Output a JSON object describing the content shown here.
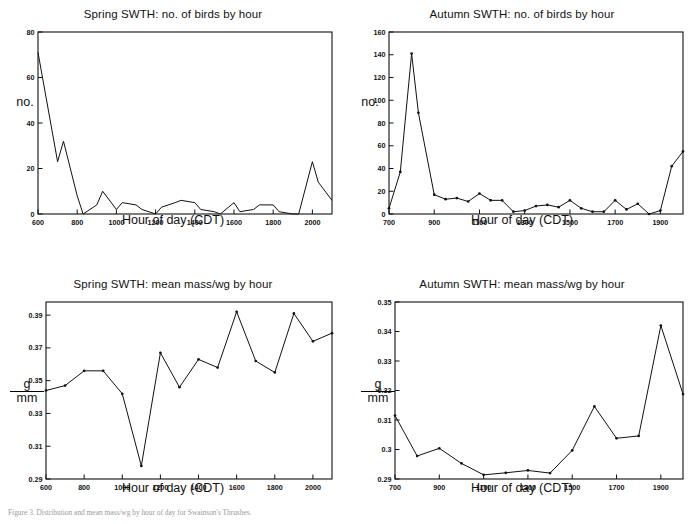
{
  "figure": {
    "caption": "Figure 3. Distribution and mean mass/wg by hour of day for Swainson's Thrushes."
  },
  "panels": [
    {
      "id": "spring-count",
      "title": "Spring SWTH: no. of birds by hour",
      "xlabel": "Hour of day (CDT)",
      "ylabel_type": "plain",
      "ylabel": "no.",
      "ylabel_num": "",
      "ylabel_den": ""
    },
    {
      "id": "autumn-count",
      "title": "Autumn SWTH: no. of birds by hour",
      "xlabel": "Hour of day (CDT)",
      "ylabel_type": "plain",
      "ylabel": "no.",
      "ylabel_num": "",
      "ylabel_den": ""
    },
    {
      "id": "spring-mass",
      "title": "Spring SWTH: mean mass/wg by hour",
      "xlabel": "Hour of day (CDT)",
      "ylabel_type": "fraction",
      "ylabel": "g/mm",
      "ylabel_num": "g",
      "ylabel_den": "mm"
    },
    {
      "id": "autumn-mass",
      "title": "Autumn SWTH: mean mass/wg by hour",
      "xlabel": "Hour of day (CDT)",
      "ylabel_type": "fraction",
      "ylabel": "g/mm",
      "ylabel_num": "g",
      "ylabel_den": "mm"
    }
  ],
  "chart_data": [
    {
      "id": "spring-count",
      "type": "line",
      "title": "Spring SWTH: no. of birds by hour",
      "xlabel": "Hour of day (CDT)",
      "ylabel": "no.",
      "xlim": [
        600,
        2100
      ],
      "ylim": [
        0,
        80
      ],
      "xticks": [
        600,
        800,
        1000,
        1200,
        1400,
        1600,
        1800,
        2000
      ],
      "xticklabels": [
        "600",
        "800",
        "1000",
        "1200",
        "1400",
        "1600",
        "1800",
        "2000"
      ],
      "yticks": [
        0,
        20,
        40,
        60,
        80
      ],
      "yticklabels": [
        "0",
        "20",
        "40",
        "60",
        "80"
      ],
      "grid": false,
      "legend": "none",
      "markers": false,
      "x": [
        600,
        700,
        730,
        800,
        830,
        900,
        930,
        1000,
        1030,
        1100,
        1130,
        1200,
        1230,
        1300,
        1330,
        1400,
        1430,
        1500,
        1530,
        1600,
        1630,
        1700,
        1730,
        1800,
        1830,
        1900,
        1930,
        2000,
        2030,
        2100
      ],
      "values": [
        71,
        23,
        32,
        8,
        0,
        4,
        10,
        2,
        5,
        4,
        2,
        0,
        3,
        5,
        6,
        5,
        2,
        1,
        0,
        5,
        1,
        2,
        4,
        4,
        1,
        0,
        0,
        23,
        14,
        6
      ]
    },
    {
      "id": "autumn-count",
      "type": "line",
      "title": "Autumn SWTH: no. of birds by hour",
      "xlabel": "Hour of day (CDT)",
      "ylabel": "no.",
      "xlim": [
        700,
        2000
      ],
      "ylim": [
        0,
        160
      ],
      "xticks": [
        700,
        900,
        1100,
        1300,
        1500,
        1700,
        1900
      ],
      "xticklabels": [
        "700",
        "900",
        "1100",
        "1300",
        "1500",
        "1700",
        "1900"
      ],
      "yticks": [
        0,
        20,
        40,
        60,
        80,
        100,
        120,
        140,
        160
      ],
      "yticklabels": [
        "0",
        "20",
        "40",
        "60",
        "80",
        "100",
        "120",
        "140",
        "160"
      ],
      "grid": false,
      "legend": "none",
      "markers": true,
      "x": [
        700,
        750,
        800,
        830,
        900,
        950,
        1000,
        1050,
        1100,
        1150,
        1200,
        1250,
        1300,
        1350,
        1400,
        1450,
        1500,
        1550,
        1600,
        1650,
        1700,
        1750,
        1800,
        1850,
        1900,
        1950,
        2000
      ],
      "values": [
        5,
        37,
        141,
        89,
        17,
        13,
        14,
        11,
        18,
        12,
        12,
        2,
        3,
        7,
        8,
        6,
        12,
        5,
        2,
        2,
        12,
        4,
        9,
        0,
        3,
        42,
        55
      ]
    },
    {
      "id": "spring-mass",
      "type": "line",
      "title": "Spring SWTH: mean mass/wg by hour",
      "xlabel": "Hour of day (CDT)",
      "ylabel": "g/mm",
      "xlim": [
        600,
        2100
      ],
      "ylim": [
        0.29,
        0.398
      ],
      "xticks": [
        600,
        800,
        1000,
        1200,
        1400,
        1600,
        1800,
        2000
      ],
      "xticklabels": [
        "600",
        "800",
        "1000",
        "1200",
        "1400",
        "1600",
        "1800",
        "2000"
      ],
      "yticks": [
        0.29,
        0.31,
        0.33,
        0.35,
        0.37,
        0.39
      ],
      "yticklabels": [
        "0.29",
        "0.31",
        "0.33",
        "0.35",
        "0.37",
        "0.39"
      ],
      "grid": false,
      "legend": "none",
      "markers": true,
      "x": [
        600,
        700,
        800,
        900,
        1000,
        1100,
        1200,
        1300,
        1400,
        1500,
        1600,
        1700,
        1800,
        1900,
        2000,
        2100
      ],
      "values": [
        0.344,
        0.347,
        0.356,
        0.356,
        0.342,
        0.298,
        0.367,
        0.346,
        0.363,
        0.358,
        0.392,
        0.362,
        0.355,
        0.391,
        0.374,
        0.379
      ]
    },
    {
      "id": "autumn-mass",
      "type": "line",
      "title": "Autumn SWTH: mean mass/wg by hour",
      "xlabel": "Hour of day (CDT)",
      "ylabel": "g/mm",
      "xlim": [
        700,
        2000
      ],
      "ylim": [
        0.29,
        0.35
      ],
      "xticks": [
        700,
        900,
        1100,
        1300,
        1500,
        1700,
        1900
      ],
      "xticklabels": [
        "700",
        "900",
        "1100",
        "1300",
        "1500",
        "1700",
        "1900"
      ],
      "yticks": [
        0.29,
        0.3,
        0.31,
        0.32,
        0.33,
        0.34,
        0.35
      ],
      "yticklabels": [
        "0.29",
        "0.3",
        "0.31",
        "0.32",
        "0.33",
        "0.34",
        "0.35"
      ],
      "grid": false,
      "legend": "none",
      "markers": true,
      "x": [
        700,
        800,
        900,
        1000,
        1100,
        1200,
        1300,
        1400,
        1500,
        1600,
        1700,
        1800,
        1900,
        2000
      ],
      "values": [
        0.3115,
        0.2978,
        0.3004,
        0.2953,
        0.2914,
        0.2921,
        0.2929,
        0.292,
        0.2997,
        0.3146,
        0.3038,
        0.3046,
        0.342,
        0.3188
      ]
    }
  ]
}
